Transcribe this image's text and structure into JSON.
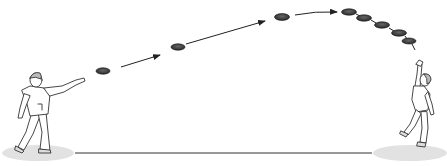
{
  "illustration": {
    "subject": "frisbee throw between two people",
    "background": "#ffffff",
    "colors": {
      "line": "#222222",
      "disc_fill": "#3a3a3a",
      "disc_rim": "#888888",
      "shadow": "#e2e2e2",
      "figure_stroke": "#333333",
      "figure_fill": "#ffffff"
    },
    "thrower": {
      "position": "left",
      "pose": "arm extended after throw"
    },
    "catcher": {
      "position": "right",
      "pose": "reaching up to catch"
    },
    "discs": [
      {
        "x": 103,
        "y": 71
      },
      {
        "x": 178,
        "y": 47
      },
      {
        "x": 282,
        "y": 17
      },
      {
        "x": 349,
        "y": 12
      },
      {
        "x": 364,
        "y": 18
      },
      {
        "x": 382,
        "y": 25
      },
      {
        "x": 399,
        "y": 33
      },
      {
        "x": 409,
        "y": 41
      }
    ],
    "arrows": [
      {
        "x1": 121,
        "y1": 67,
        "x2": 160,
        "y2": 55
      },
      {
        "x1": 186,
        "y1": 44,
        "x2": 265,
        "y2": 21
      },
      {
        "x1": 295,
        "y1": 15,
        "x2": 337,
        "y2": 12
      }
    ],
    "ground_line": {
      "x1": 75,
      "y1": 153,
      "x2": 372,
      "y2": 153
    }
  }
}
